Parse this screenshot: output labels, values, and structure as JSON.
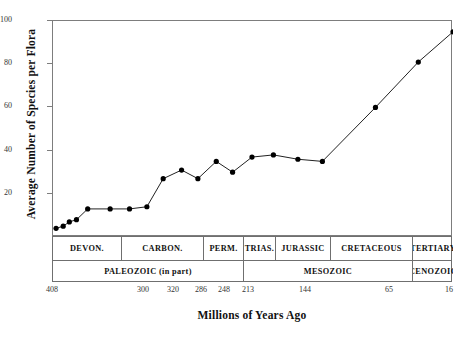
{
  "chart_data": {
    "type": "line",
    "title": "Local Diversity of Plants",
    "xlabel": "Millions of Years Ago",
    "ylabel": "Average Number of Species per Flora",
    "xlim": [
      408,
      16
    ],
    "ylim": [
      0,
      100
    ],
    "x_reversed": true,
    "grid": false,
    "legend": null,
    "marker": "filled-circle",
    "line_color": "#222222",
    "marker_color": "#000000",
    "frame_color": "#7d7d7d",
    "y_ticks": [
      20,
      40,
      60,
      80,
      100
    ],
    "x_ticks": [
      408,
      300,
      320,
      286,
      248,
      213,
      144,
      65,
      16
    ],
    "x": [
      405,
      398,
      392,
      385,
      374,
      352,
      333,
      316,
      300,
      282,
      262,
      245,
      232,
      213,
      196,
      172,
      148,
      108,
      72,
      38,
      18
    ],
    "y": [
      4,
      5,
      6,
      8,
      13,
      13,
      13,
      14,
      27,
      31,
      27,
      35,
      30,
      37,
      38,
      36,
      35,
      60,
      81,
      95
    ],
    "points": [
      {
        "x": 405,
        "y": 4
      },
      {
        "x": 398,
        "y": 5
      },
      {
        "x": 392,
        "y": 7
      },
      {
        "x": 385,
        "y": 8
      },
      {
        "x": 374,
        "y": 13
      },
      {
        "x": 352,
        "y": 13
      },
      {
        "x": 333,
        "y": 13
      },
      {
        "x": 316,
        "y": 14
      },
      {
        "x": 300,
        "y": 27
      },
      {
        "x": 282,
        "y": 31
      },
      {
        "x": 266,
        "y": 27
      },
      {
        "x": 248,
        "y": 35
      },
      {
        "x": 232,
        "y": 30
      },
      {
        "x": 213,
        "y": 37
      },
      {
        "x": 192,
        "y": 38
      },
      {
        "x": 168,
        "y": 36
      },
      {
        "x": 144,
        "y": 35
      },
      {
        "x": 92,
        "y": 60
      },
      {
        "x": 50,
        "y": 81
      },
      {
        "x": 16,
        "y": 95
      }
    ]
  },
  "geologic_scale": {
    "periods_row": [
      {
        "label": "DEVON.",
        "span": 0.1725
      },
      {
        "label": "CARBON.",
        "span": 0.205
      },
      {
        "label": "PERM.",
        "span": 0.1
      },
      {
        "label": "TRIAS.",
        "span": 0.08
      },
      {
        "label": "JURASSIC",
        "span": 0.1375
      },
      {
        "label": "CRETACEOUS",
        "span": 0.205
      },
      {
        "label": "TERTIARY",
        "span": 0.1
      }
    ],
    "eras_row": [
      {
        "label": "PALEOZOIC (in part)",
        "span": 0.4775
      },
      {
        "label": "MESOZOIC",
        "span": 0.4225
      },
      {
        "label": "CENOZOIC",
        "span": 0.1
      }
    ]
  },
  "axis": {
    "y_tick_labels": [
      "100",
      "80",
      "60",
      "40",
      "20"
    ],
    "x_tick_labels": [
      "408",
      "300",
      "320",
      "286",
      "248",
      "213",
      "144",
      "65",
      "16"
    ]
  }
}
